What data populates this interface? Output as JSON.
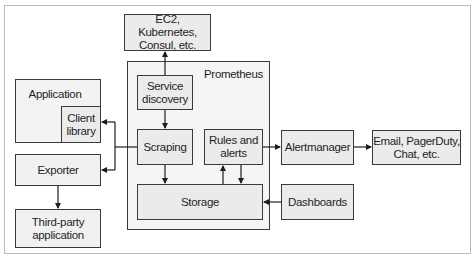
{
  "diagram": {
    "colors": {
      "box_fill": "#ebebeb",
      "container_fill": "#f5f5f5",
      "stroke": "#3a3a3a",
      "frame": "#b9b9b9"
    },
    "nodes": {
      "ec2": "EC2, Kubernetes, Consul, etc.",
      "prometheus": "Prometheus",
      "service_discovery": "Service discovery",
      "scraping": "Scraping",
      "rules": "Rules and alerts",
      "storage": "Storage",
      "application": "Application",
      "client_library": "Client library",
      "exporter": "Exporter",
      "third_party": "Third-party application",
      "alertmanager": "Alertmanager",
      "notifications": "Email, PagerDuty, Chat, etc.",
      "dashboards": "Dashboards"
    },
    "lines": {
      "ec2_l1": "EC2, Kubernetes,",
      "ec2_l2": "Consul, etc.",
      "sd_l1": "Service",
      "sd_l2": "discovery",
      "rules_l1": "Rules and",
      "rules_l2": "alerts",
      "client_l1": "Client",
      "client_l2": "library",
      "tp_l1": "Third-party",
      "tp_l2": "application",
      "notif_l1": "Email, PagerDuty,",
      "notif_l2": "Chat, etc."
    },
    "edges": [
      {
        "from": "service_discovery",
        "to": "ec2"
      },
      {
        "from": "service_discovery",
        "to": "scraping"
      },
      {
        "from": "scraping",
        "to": "client_library"
      },
      {
        "from": "scraping",
        "to": "exporter"
      },
      {
        "from": "exporter",
        "to": "third_party"
      },
      {
        "from": "scraping",
        "to": "storage"
      },
      {
        "from": "storage",
        "to": "rules"
      },
      {
        "from": "rules",
        "to": "storage"
      },
      {
        "from": "rules",
        "to": "alertmanager"
      },
      {
        "from": "alertmanager",
        "to": "notifications"
      },
      {
        "from": "dashboards",
        "to": "storage"
      }
    ]
  }
}
